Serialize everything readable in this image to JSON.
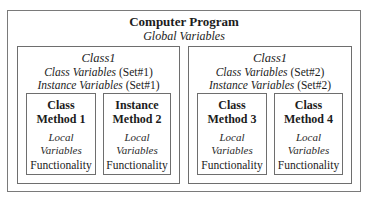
{
  "program": {
    "title": "Computer Program",
    "subtitle": "Global Variables"
  },
  "classes": [
    {
      "name": "Class1",
      "class_vars_label": "Class Variables",
      "class_vars_set": " (Set#1)",
      "instance_vars_label": "Instance Variables",
      "instance_vars_set": " (Set#1)",
      "methods": [
        {
          "title_line1": "Class",
          "title_line2": "Method 1",
          "local_line1": "Local",
          "local_line2": "Variables",
          "body": "Functionality"
        },
        {
          "title_line1": "Instance",
          "title_line2": "Method 2",
          "local_line1": "Local",
          "local_line2": "Variables",
          "body": "Functionality"
        }
      ]
    },
    {
      "name": "Class1",
      "class_vars_label": "Class Variables",
      "class_vars_set": " (Set#2)",
      "instance_vars_label": "Instance Variables",
      "instance_vars_set": " (Set#2)",
      "methods": [
        {
          "title_line1": "Class",
          "title_line2": "Method 3",
          "local_line1": "Local",
          "local_line2": "Variables",
          "body": "Functionality"
        },
        {
          "title_line1": "Class",
          "title_line2": "Method 4",
          "local_line1": "Local",
          "local_line2": "Variables",
          "body": "Functionality"
        }
      ]
    }
  ]
}
